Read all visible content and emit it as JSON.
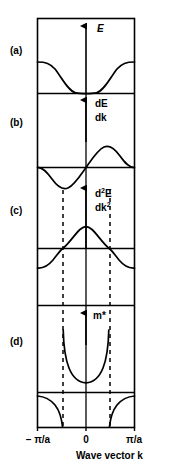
{
  "figure": {
    "axis": {
      "xlabel": "Wave vector k",
      "ticks": [
        {
          "label": "– π/a",
          "x": -1
        },
        {
          "label": "0",
          "x": 0
        },
        {
          "label": "π/a",
          "x": 1
        }
      ]
    },
    "panels": [
      {
        "id": "a",
        "label": "(a)",
        "quantity": "E",
        "quantity_html": "E",
        "description": "Energy E versus wave vector k; cosine-like band with minimum at k = 0 and maxima at the zone boundaries."
      },
      {
        "id": "b",
        "label": "(b)",
        "quantity": "dE/dk",
        "quantity_line1": "dE",
        "quantity_line2": "dk",
        "description": "First derivative dE/dk (group velocity); sine-like, zero at k = 0 and at the zone boundaries."
      },
      {
        "id": "c",
        "label": "(c)",
        "quantity": "d2E/dk2",
        "quantity_line1_pre": "d",
        "quantity_line1_sup": "2",
        "quantity_line1_post": "E",
        "quantity_line2_pre": "dk",
        "quantity_line2_sup": "2",
        "description": "Second derivative d²E/dk² (band curvature); positive near k = 0, changing sign at the inflection points shown by the dashed lines."
      },
      {
        "id": "d",
        "label": "(d)",
        "quantity": "m*",
        "quantity_html": "m*",
        "description": "Effective mass m* proportional to 1/(d²E/dk²); positive and finite near k = 0, diverging at the inflection points and negative beyond them."
      }
    ],
    "annotations": {
      "dashed_lines_meaning": "inflection points of E(k)",
      "dashed_positions": [
        -0.48,
        0.48
      ]
    },
    "colors": {
      "ink": "#000000",
      "background": "#ffffff",
      "curve": "#000000",
      "dashed": "#000000"
    }
  }
}
